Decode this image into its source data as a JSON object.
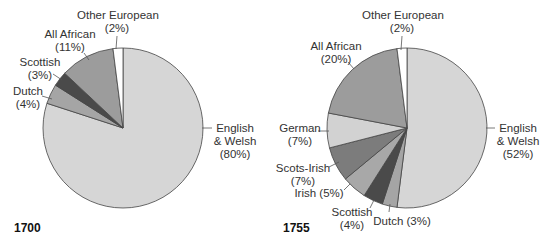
{
  "chart_data": [
    {
      "type": "pie",
      "title": "1700",
      "start_angle": "12 o'clock, clockwise",
      "slices": [
        {
          "label": "English & Welsh",
          "value": 80,
          "color": "#d6d6d6"
        },
        {
          "label": "Dutch",
          "value": 4,
          "color": "#a5a5a5"
        },
        {
          "label": "Scottish",
          "value": 3,
          "color": "#4a4a4a"
        },
        {
          "label": "All African",
          "value": 11,
          "color": "#9c9c9c"
        },
        {
          "label": "Other European",
          "value": 2,
          "color": "#ffffff"
        }
      ]
    },
    {
      "type": "pie",
      "title": "1755",
      "start_angle": "12 o'clock, clockwise",
      "slices": [
        {
          "label": "English & Welsh",
          "value": 52,
          "color": "#d6d6d6"
        },
        {
          "label": "Dutch",
          "value": 3,
          "color": "#a5a5a5"
        },
        {
          "label": "Scottish",
          "value": 4,
          "color": "#4a4a4a"
        },
        {
          "label": "Irish",
          "value": 5,
          "color": "#a8a8a8"
        },
        {
          "label": "Scots-Irish",
          "value": 7,
          "color": "#7c7c7c"
        },
        {
          "label": "German",
          "value": 7,
          "color": "#d2d2d2"
        },
        {
          "label": "All African",
          "value": 20,
          "color": "#9c9c9c"
        },
        {
          "label": "Other European",
          "value": 2,
          "color": "#ffffff"
        }
      ]
    }
  ],
  "labels": {
    "c1": {
      "year": "1700",
      "other_european": [
        "Other European",
        "(2%)"
      ],
      "all_african": [
        "All African",
        "(11%)"
      ],
      "scottish": [
        "Scottish",
        "(3%)"
      ],
      "dutch": [
        "Dutch",
        "(4%)"
      ],
      "english_welsh": [
        "English",
        "& Welsh",
        "(80%)"
      ]
    },
    "c2": {
      "year": "1755",
      "other_european": [
        "Other European",
        "(2%)"
      ],
      "all_african": [
        "All African",
        "(20%)"
      ],
      "german": [
        "German",
        "(7%)"
      ],
      "scots_irish": [
        "Scots-Irish",
        "(7%)"
      ],
      "irish": "Irish (5%)",
      "scottish": [
        "Scottish",
        "(4%)"
      ],
      "dutch": "Dutch (3%)",
      "english_welsh": [
        "English",
        "& Welsh",
        "(52%)"
      ]
    }
  }
}
